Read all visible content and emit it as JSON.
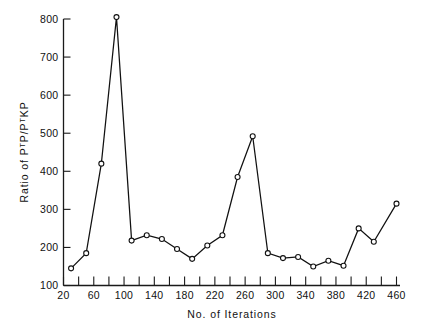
{
  "chart_data": {
    "type": "line",
    "title": "",
    "xlabel": "No. of Iterations",
    "ylabel": "Ratio of PTP/PTKP",
    "ylabel_parts": {
      "prefix": "Ratio of  P",
      "sup1": "T",
      "mid1": "P/P",
      "sup2": "T",
      "suffix": "KP"
    },
    "xlim": [
      20,
      460
    ],
    "ylim": [
      100,
      800
    ],
    "grid": false,
    "legend": null,
    "xticks_major": [
      20,
      60,
      100,
      140,
      180,
      220,
      260,
      300,
      340,
      380,
      420,
      460
    ],
    "xticks_minor": [
      40,
      80,
      120,
      160,
      200,
      240,
      280,
      320,
      360,
      400,
      440
    ],
    "yticks_major": [
      100,
      200,
      300,
      400,
      500,
      600,
      700,
      800
    ],
    "x": [
      30,
      50,
      70,
      90,
      110,
      130,
      150,
      170,
      190,
      210,
      230,
      250,
      270,
      290,
      310,
      330,
      350,
      370,
      390,
      410,
      430,
      460
    ],
    "values": [
      145,
      185,
      420,
      805,
      218,
      232,
      222,
      196,
      170,
      205,
      232,
      385,
      492,
      185,
      172,
      175,
      150,
      165,
      152,
      250,
      215,
      315
    ],
    "series": [
      {
        "name": "PTP/PTKP ratio",
        "x": [
          30,
          50,
          70,
          90,
          110,
          130,
          150,
          170,
          190,
          210,
          230,
          250,
          270,
          290,
          310,
          330,
          350,
          370,
          390,
          410,
          430,
          460
        ],
        "values": [
          145,
          185,
          420,
          805,
          218,
          232,
          222,
          196,
          170,
          205,
          232,
          385,
          492,
          185,
          172,
          175,
          150,
          165,
          152,
          250,
          215,
          315
        ],
        "marker": "open-circle",
        "color": "#111111"
      }
    ],
    "colors": {
      "line": "#111111",
      "marker_fill": "#ffffff",
      "axis": "#1a1a1a",
      "background": "#ffffff"
    }
  },
  "x_tick_labels": [
    "20",
    "60",
    "100",
    "140",
    "180",
    "220",
    "260",
    "300",
    "340",
    "380",
    "420",
    "460"
  ],
  "y_tick_labels": [
    "100",
    "200",
    "300",
    "400",
    "500",
    "600",
    "700",
    "800"
  ]
}
